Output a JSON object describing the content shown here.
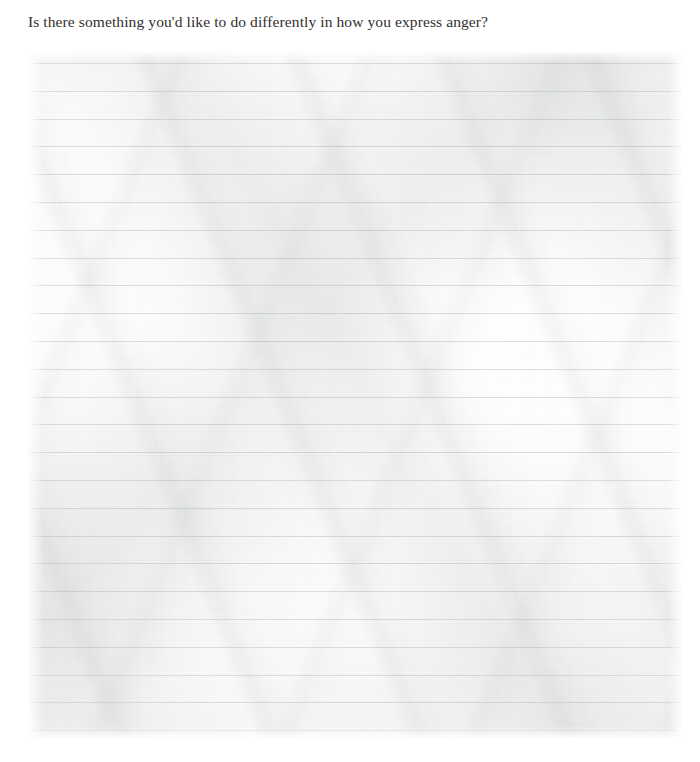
{
  "page": {
    "width": 700,
    "height": 762,
    "background_color": "#ffffff"
  },
  "prompt": {
    "question": "Is there something you'd like to do differently in how you express anger?"
  },
  "writing_area": {
    "label": "lined writing area",
    "placeholder": "",
    "value": "",
    "paper_style": "crumpled ruled notebook paper",
    "rule_count": 25,
    "rule_spacing_px": 27.8,
    "first_rule_y_px": 11,
    "rule_color": "#d9dde0",
    "paper_color": "#fdfdfd",
    "sheet_left_px": 28,
    "sheet_top_px": 52,
    "sheet_width_px": 654,
    "sheet_height_px": 686
  }
}
